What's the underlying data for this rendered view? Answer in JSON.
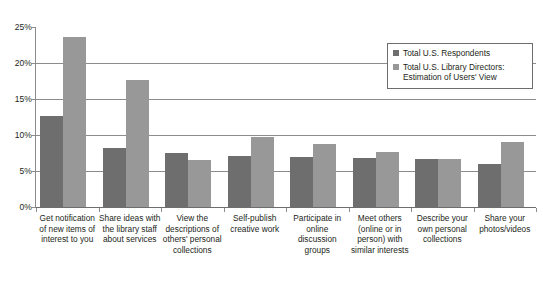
{
  "chart_data": {
    "type": "bar",
    "title": "",
    "subtitle": "",
    "xlabel": "",
    "ylabel": "",
    "ylim": [
      0,
      25
    ],
    "grid": true,
    "legend_position": "top-right",
    "y_ticks": [
      "0%",
      "5%",
      "10%",
      "15%",
      "20%",
      "25%"
    ],
    "y_tick_values": [
      0,
      5,
      10,
      15,
      20,
      25
    ],
    "categories": [
      "Get notification of new items of interest to you",
      "Share ideas with the library staff about services",
      "View the descriptions of others' personal collections",
      "Self-publish creative work",
      "Participate in online discussion groups",
      "Meet others (online or in person) with similar interests",
      "Describe your own personal collections",
      "Share your photos/videos"
    ],
    "series": [
      {
        "name": "Total U.S. Respondents",
        "color": "#6e6e6e",
        "values": [
          12.6,
          8.2,
          7.5,
          7.1,
          6.9,
          6.8,
          6.6,
          6.0
        ]
      },
      {
        "name": "Total U.S. Library Directors: Estimation of Users' View",
        "color": "#989898",
        "values": [
          23.6,
          17.7,
          6.5,
          9.7,
          8.8,
          7.6,
          6.6,
          9.0
        ]
      }
    ]
  },
  "legend": {
    "items": [
      {
        "label": "Total U.S. Respondents"
      },
      {
        "label": "Total U.S. Library Directors: Estimation of Users' View"
      }
    ]
  }
}
